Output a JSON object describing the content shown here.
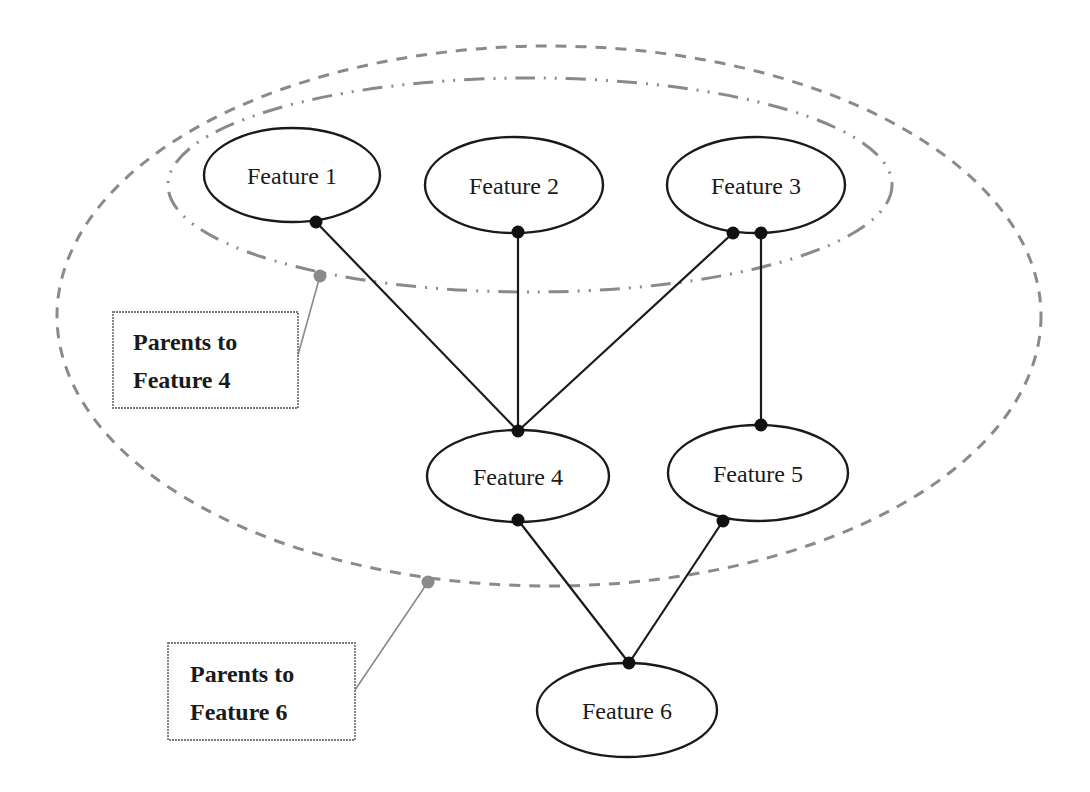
{
  "diagram": {
    "type": "feature-dependency-graph",
    "colors": {
      "node_stroke": "#1a1a1a",
      "edge": "#1a1a1a",
      "group_outline": "#8a8a8a",
      "callout": "#8a8a8a"
    },
    "nodes": [
      {
        "id": "f1",
        "label": "Feature 1"
      },
      {
        "id": "f2",
        "label": "Feature 2"
      },
      {
        "id": "f3",
        "label": "Feature 3"
      },
      {
        "id": "f4",
        "label": "Feature 4"
      },
      {
        "id": "f5",
        "label": "Feature 5"
      },
      {
        "id": "f6",
        "label": "Feature 6"
      }
    ],
    "edges": [
      {
        "from": "Feature 1",
        "to": "Feature 4"
      },
      {
        "from": "Feature 2",
        "to": "Feature 4"
      },
      {
        "from": "Feature 3",
        "to": "Feature 4"
      },
      {
        "from": "Feature 3",
        "to": "Feature 5"
      },
      {
        "from": "Feature 4",
        "to": "Feature 6"
      },
      {
        "from": "Feature 5",
        "to": "Feature 6"
      }
    ],
    "groups": [
      {
        "id": "parents-f4",
        "style": "dash-dot-dot",
        "members": [
          "Feature 1",
          "Feature 2",
          "Feature 3"
        ],
        "callout": {
          "line1": "Parents to",
          "line2": "Feature 4"
        }
      },
      {
        "id": "parents-f6",
        "style": "dashed",
        "members": [
          "Feature 1",
          "Feature 2",
          "Feature 3",
          "Feature 4",
          "Feature 5"
        ],
        "callout": {
          "line1": "Parents to",
          "line2": "Feature 6"
        }
      }
    ]
  }
}
